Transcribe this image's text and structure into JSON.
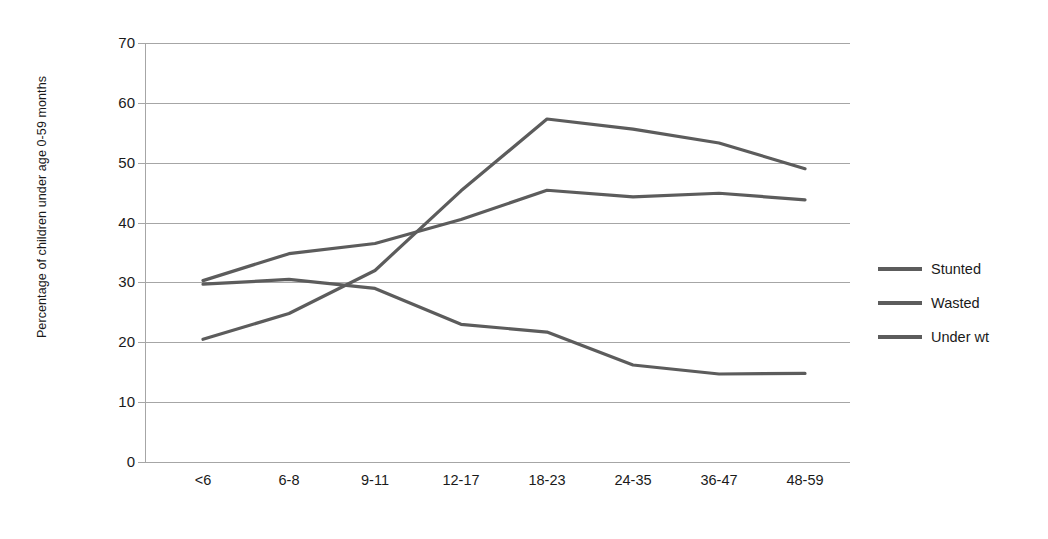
{
  "chart_data": {
    "type": "line",
    "title": "",
    "xlabel": "",
    "ylabel": "Percentage of children under age 0-59 months",
    "categories": [
      "<6",
      "6-8",
      "9-11",
      "12-17",
      "18-23",
      "24-35",
      "36-47",
      "48-59"
    ],
    "ylim": [
      0,
      70
    ],
    "yticks": [
      0,
      10,
      20,
      30,
      40,
      50,
      60,
      70
    ],
    "grid": true,
    "legend_position": "right",
    "series": [
      {
        "name": "Stunted",
        "values": [
          20.5,
          24.8,
          32.0,
          45.3,
          57.3,
          55.6,
          53.3,
          49.0
        ],
        "color": "#5c5c5c"
      },
      {
        "name": "Wasted",
        "values": [
          30.3,
          34.8,
          36.5,
          40.5,
          45.4,
          44.3,
          44.9,
          43.8
        ],
        "color": "#5c5c5c"
      },
      {
        "name": "Under wt",
        "values": [
          29.7,
          30.5,
          29.0,
          23.0,
          21.7,
          16.2,
          14.7,
          14.8
        ],
        "color": "#5c5c5c"
      }
    ]
  },
  "axes": {
    "y_title": "Percentage of children under age 0-59 months",
    "y_tick_labels": [
      "70",
      "60",
      "50",
      "40",
      "30",
      "20",
      "10",
      "0"
    ],
    "x_tick_labels": [
      "<6",
      "6-8",
      "9-11",
      "12-17",
      "18-23",
      "24-35",
      "36-47",
      "48-59"
    ]
  },
  "legend": {
    "items": [
      {
        "label": "Stunted"
      },
      {
        "label": "Wasted"
      },
      {
        "label": "Under wt"
      }
    ]
  },
  "colors": {
    "line": "#5c5c5c",
    "grid": "#a6a6a6",
    "text": "#1a1a1a",
    "background": "#ffffff"
  }
}
